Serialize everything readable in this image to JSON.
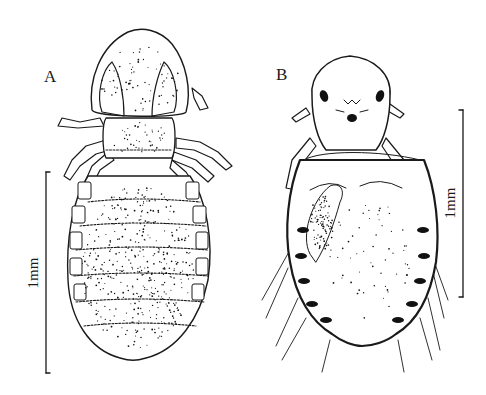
{
  "figure": {
    "panels": [
      {
        "label": "A",
        "view": "dorsal",
        "scale_bar_label": "1mm"
      },
      {
        "label": "B",
        "view": "ventral",
        "scale_bar_label": "1mm"
      }
    ]
  }
}
